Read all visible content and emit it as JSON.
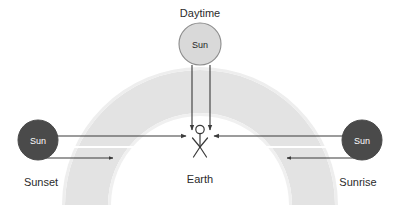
{
  "diagram": {
    "background_color": "#ffffff",
    "labels": {
      "daytime": "Daytime",
      "sunset": "Sunset",
      "sunrise": "Sunrise",
      "earth": "Earth"
    },
    "suns": {
      "daytime": {
        "label": "Sun",
        "fill": "#d9d9d9",
        "stroke": "#8c8c8c",
        "text_color": "#1f1f1f",
        "cx": 200,
        "cy": 44,
        "r": 21
      },
      "sunset": {
        "label": "Sun",
        "fill": "#4a4a4a",
        "stroke": "#4a4a4a",
        "text_color": "#ffffff",
        "cx": 38,
        "cy": 140,
        "r": 20
      },
      "sunrise": {
        "label": "Sun",
        "fill": "#4a4a4a",
        "stroke": "#4a4a4a",
        "text_color": "#ffffff",
        "cx": 362,
        "cy": 140,
        "r": 20
      }
    },
    "atmosphere": {
      "name": "atmosphere-arc",
      "fill": "#e2e2e2",
      "center_x": 200,
      "center_y": 205,
      "outer_radius": 135,
      "inner_radius": 92
    },
    "observer": {
      "name": "stick-figure-observer",
      "stroke": "#3a3a3a",
      "x": 200,
      "y": 137
    },
    "rays": {
      "stroke": "#3a3a3a",
      "highlight_stroke": "#ffffff",
      "daytime_ray_left_x": 192,
      "daytime_ray_right_x": 210,
      "daytime_ray_top_y": 65,
      "daytime_ray_bottom_y": 131,
      "horizontal_ray_y": 136,
      "lower_ray_y": 158,
      "highlight_y": 147
    }
  }
}
